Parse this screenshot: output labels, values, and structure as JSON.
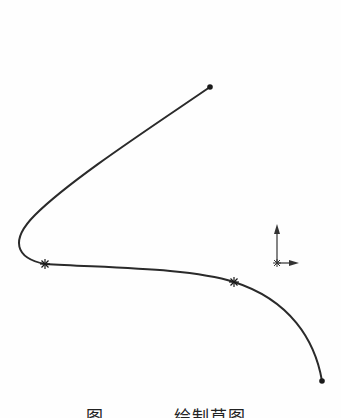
{
  "figure": {
    "caption_label": "图",
    "caption_number": "",
    "caption_title": "绘制草图"
  },
  "sketch": {
    "stroke_color": "#2a2a2a",
    "spline": {
      "start_point": [
        210,
        87
      ],
      "end_point": [
        322,
        381
      ],
      "through_points": [
        [
          45,
          264
        ],
        [
          234,
          282
        ]
      ],
      "leftmost_point": [
        17,
        248
      ]
    },
    "coordinate_axes": {
      "origin": [
        277,
        263
      ],
      "x_axis_end": [
        298,
        263
      ],
      "y_axis_end": [
        277,
        225
      ]
    }
  }
}
